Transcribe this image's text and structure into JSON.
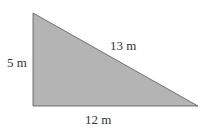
{
  "figure": {
    "shape": "right-triangle",
    "fill_color": "#b4b4b4",
    "edge_color": "#555555",
    "labels": {
      "vertical_side": "5 m",
      "hypotenuse": "13 m",
      "base": "12 m"
    }
  }
}
